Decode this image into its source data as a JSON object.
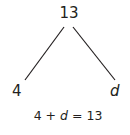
{
  "diagram": {
    "type": "number-bond",
    "whole": "13",
    "parts": [
      "4",
      "d"
    ],
    "variable": "d",
    "equation": {
      "left": "4",
      "op": "+",
      "var": "d",
      "eq": "=",
      "right": "13"
    },
    "colors": {
      "ink": "#231f20",
      "background": "#ffffff"
    }
  }
}
